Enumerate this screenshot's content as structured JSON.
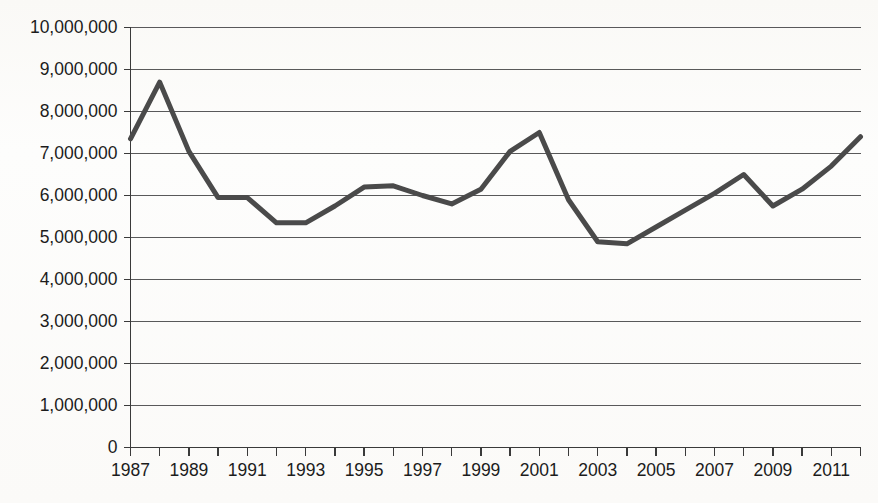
{
  "chart_data": {
    "type": "line",
    "title": "",
    "subtitle": "",
    "xlabel": "",
    "ylabel": "",
    "xlim": [
      1987,
      2012
    ],
    "ylim": [
      0,
      10000000
    ],
    "grid": true,
    "legend": false,
    "legend_position": "none",
    "line_color": "#4a4a4a",
    "line_width": 5,
    "axis_color": "#3a3a3a",
    "gridline_color": "#59595a",
    "text_color": "#1c1c1c",
    "background_color": "#fdfdfc",
    "y_ticks": [
      0,
      1000000,
      2000000,
      3000000,
      4000000,
      5000000,
      6000000,
      7000000,
      8000000,
      9000000,
      10000000
    ],
    "y_tick_labels": [
      "0",
      "1,000,000",
      "2,000,000",
      "3,000,000",
      "4,000,000",
      "5,000,000",
      "6,000,000",
      "7,000,000",
      "8,000,000",
      "9,000,000",
      "10,000,000"
    ],
    "x_ticks": [
      1987,
      1988,
      1989,
      1990,
      1991,
      1992,
      1993,
      1994,
      1995,
      1996,
      1997,
      1998,
      1999,
      2000,
      2001,
      2002,
      2003,
      2004,
      2005,
      2006,
      2007,
      2008,
      2009,
      2010,
      2011,
      2012
    ],
    "x_tick_labels_shown": [
      "1987",
      "1989",
      "1991",
      "1993",
      "1995",
      "1997",
      "1999",
      "2001",
      "2003",
      "2005",
      "2007",
      "2009",
      "2011"
    ],
    "x_label_interval": 2,
    "x": [
      1987,
      1988,
      1989,
      1990,
      1991,
      1992,
      1993,
      1994,
      1995,
      1996,
      1997,
      1998,
      1999,
      2000,
      2001,
      2002,
      2003,
      2004,
      2005,
      2006,
      2007,
      2008,
      2009,
      2010,
      2011,
      2012
    ],
    "values": [
      7350000,
      8700000,
      7050000,
      5950000,
      5950000,
      5350000,
      5350000,
      5750000,
      6200000,
      6230000,
      6000000,
      5800000,
      6150000,
      7050000,
      7500000,
      5900000,
      4900000,
      4850000,
      5250000,
      5650000,
      6050000,
      6500000,
      5750000,
      6150000,
      6700000,
      7400000
    ],
    "series": [
      {
        "name": "",
        "values": [
          7350000,
          8700000,
          7050000,
          5950000,
          5950000,
          5350000,
          5350000,
          5750000,
          6200000,
          6230000,
          6000000,
          5800000,
          6150000,
          7050000,
          7500000,
          5900000,
          4900000,
          4850000,
          5250000,
          5650000,
          6050000,
          6500000,
          5750000,
          6150000,
          6700000,
          7400000
        ]
      }
    ],
    "annotations": []
  }
}
